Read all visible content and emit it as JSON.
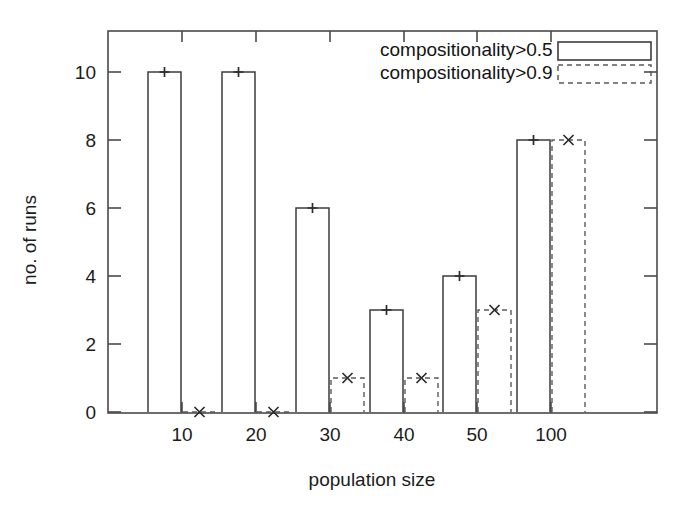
{
  "chart_data": {
    "type": "bar",
    "title": "",
    "subtitle": "",
    "xlabel": "population size",
    "ylabel": "no. of runs",
    "categories": [
      "10",
      "20",
      "30",
      "40",
      "50",
      "100"
    ],
    "series": [
      {
        "name": "compositionality>0.5",
        "style": "solid",
        "marker": "plus",
        "values": [
          10,
          10,
          6,
          3,
          4,
          8
        ]
      },
      {
        "name": "compositionality>0.9",
        "style": "dashed",
        "marker": "cross",
        "values": [
          0,
          0,
          1,
          1,
          3,
          8
        ]
      }
    ],
    "ylim": [
      0,
      11
    ],
    "ytick_labels": [
      "0",
      "2",
      "4",
      "6",
      "8",
      "10"
    ],
    "ytick_values": [
      0,
      2,
      4,
      6,
      8,
      10
    ],
    "xtick_labels": [
      "10",
      "20",
      "30",
      "40",
      "50",
      "100"
    ],
    "grid": false,
    "legend_position": "top-right",
    "colors": {
      "axis": "#4a4a4a",
      "series_solid": "#3d3d3d",
      "series_dashed": "#5a5a5a",
      "text": "#1c1c1c",
      "background": "#ffffff"
    }
  },
  "legend": {
    "entries": [
      {
        "label": "compositionality>0.5"
      },
      {
        "label": "compositionality>0.9"
      }
    ]
  },
  "axes": {
    "y_title": "no. of runs",
    "x_title": "population size",
    "y_ticks": [
      "10",
      "8",
      "6",
      "4",
      "2",
      "0"
    ],
    "x_ticks": [
      "10",
      "20",
      "30",
      "40",
      "50",
      "100"
    ]
  }
}
